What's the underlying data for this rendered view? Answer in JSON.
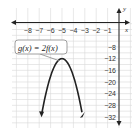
{
  "chart_data": {
    "type": "line",
    "title": "",
    "xlabel": "x",
    "ylabel": "y",
    "xlim": [
      -9,
      0.5
    ],
    "ylim": [
      -36,
      -4
    ],
    "x_ticks": [
      "-8",
      "-7",
      "-6",
      "-5",
      "-4",
      "-3",
      "-2",
      "-1"
    ],
    "y_ticks": [
      "-8",
      "-12",
      "-16",
      "-20",
      "-24",
      "-28",
      "-32"
    ],
    "grid": true,
    "series": [
      {
        "name": "g(x) = 2f(x)",
        "equation": "g(x) = 2f(x)",
        "shape": "downward parabola",
        "vertex": [
          -5,
          -12
        ],
        "x": [
          -7,
          -6.5,
          -6,
          -5.5,
          -5,
          -4.5,
          -4,
          -3.5,
          -3
        ],
        "y": [
          -36,
          -25.5,
          -18,
          -13.5,
          -12,
          -13.5,
          -18,
          -25.5,
          -36
        ],
        "color": "#222222"
      }
    ],
    "annotations": [
      {
        "text": "g(x) = 2f(x)",
        "points_to": [
          -5,
          -12
        ]
      }
    ]
  },
  "labels": {
    "x_axis": "x",
    "y_axis": "y",
    "callout": "g(x) = 2f(x)"
  }
}
